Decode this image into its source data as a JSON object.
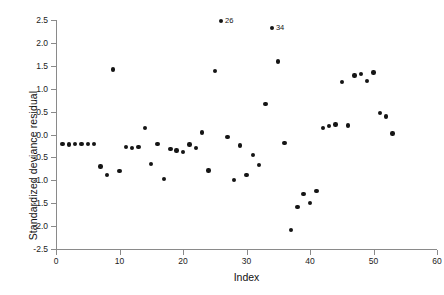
{
  "chart_data": {
    "type": "scatter",
    "title": "",
    "xlabel": "Index",
    "ylabel": "Standardized deviance residual",
    "xlim": [
      0,
      60
    ],
    "ylim": [
      -2.5,
      2.5
    ],
    "xticks": [
      0,
      10,
      20,
      30,
      40,
      50,
      60
    ],
    "xtick_labels": [
      "0",
      "10",
      "20",
      "30",
      "40",
      "50",
      "60"
    ],
    "yticks": [
      -2.5,
      -2.0,
      -1.5,
      -1.0,
      -0.5,
      0.0,
      0.5,
      1.0,
      1.5,
      2.0,
      2.5
    ],
    "ytick_labels": [
      "-2.5",
      "-2.0",
      "-1.5",
      "-1.0",
      "-0.5",
      "0.0",
      "0.5",
      "1.0",
      "1.5",
      "2.0",
      "2.5"
    ],
    "grid": false,
    "legend": false,
    "marker": "filled-circle",
    "marker_color": "#151515",
    "x": [
      1,
      2,
      3,
      4,
      5,
      6,
      7,
      8,
      9,
      10,
      11,
      12,
      13,
      14,
      15,
      16,
      17,
      18,
      19,
      20,
      21,
      22,
      23,
      24,
      25,
      26,
      27,
      28,
      29,
      30,
      31,
      32,
      33,
      34,
      35,
      36,
      37,
      38,
      39,
      40,
      41,
      42,
      43,
      44,
      45,
      46,
      47,
      48,
      49,
      50,
      51,
      52,
      53
    ],
    "y": [
      -0.21,
      -0.22,
      -0.21,
      -0.21,
      -0.21,
      -0.21,
      -0.7,
      -0.88,
      1.42,
      -0.8,
      -0.27,
      -0.29,
      -0.27,
      0.14,
      -0.65,
      -0.21,
      -0.97,
      -0.32,
      -0.35,
      -0.38,
      -0.22,
      -0.3,
      0.04,
      -0.79,
      1.38,
      2.48,
      -0.05,
      -0.99,
      -0.24,
      -0.88,
      -0.45,
      -0.67,
      0.67,
      2.33,
      1.59,
      -0.18,
      -2.09,
      -1.58,
      -1.3,
      -1.5,
      -1.24,
      0.14,
      0.18,
      0.22,
      1.14,
      0.2,
      1.29,
      1.32,
      1.17,
      1.35,
      0.47,
      0.39,
      0.02
    ],
    "annotations": [
      {
        "index": 26,
        "label": "26",
        "x": 26,
        "y": 2.48
      },
      {
        "index": 34,
        "label": "34",
        "x": 34,
        "y": 2.33
      }
    ],
    "axis_color": "#8a8a8a",
    "background_color": "#ffffff"
  }
}
